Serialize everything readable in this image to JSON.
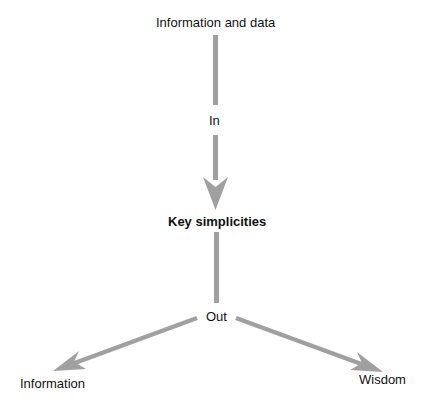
{
  "nodes": {
    "source": "Information and data",
    "in_label": "In",
    "center": "Key simplicities",
    "out_label": "Out",
    "output_left": "Information",
    "output_right": "Wisdom"
  },
  "colors": {
    "arrow": "#a0a0a0",
    "text": "#111111",
    "background": "#ffffff"
  }
}
